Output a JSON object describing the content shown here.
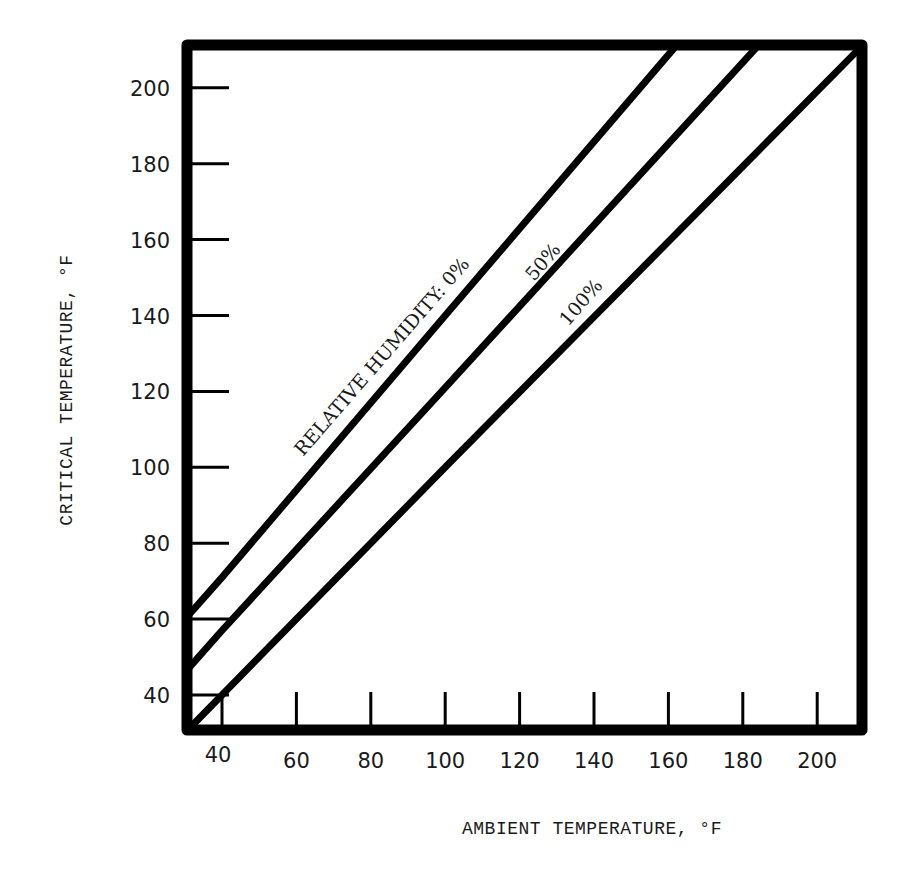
{
  "chart_data": {
    "type": "line",
    "title": "",
    "xlabel": "AMBIENT TEMPERATURE, °F",
    "ylabel": "CRITICAL TEMPERATURE, °F",
    "xlim": [
      31,
      212
    ],
    "ylim": [
      31,
      211
    ],
    "grid": false,
    "legend": "inline annotations along lines",
    "x_ticks": [
      40,
      60,
      80,
      100,
      120,
      140,
      160,
      180,
      200
    ],
    "y_ticks": [
      40,
      60,
      80,
      100,
      120,
      140,
      160,
      180,
      200
    ],
    "annotation_prefix": "RELATIVE HUMIDITY:",
    "series": [
      {
        "name": "0%",
        "label": "0%",
        "points": [
          [
            31,
            61
          ],
          [
            40,
            71
          ],
          [
            100,
            140
          ],
          [
            162,
            211
          ]
        ]
      },
      {
        "name": "50%",
        "label": "50%",
        "points": [
          [
            31,
            47
          ],
          [
            40,
            57
          ],
          [
            100,
            121
          ],
          [
            184,
            211
          ]
        ]
      },
      {
        "name": "100%",
        "label": "100%",
        "points": [
          [
            31,
            31
          ],
          [
            40,
            40
          ],
          [
            100,
            100
          ],
          [
            212,
            211
          ]
        ]
      }
    ]
  },
  "labels": {
    "annotation_full": "RELATIVE HUMIDITY: 0%",
    "line50": "50%",
    "line100": "100%",
    "xlabel": "AMBIENT TEMPERATURE, °F",
    "ylabel": "CRITICAL TEMPERATURE, °F"
  },
  "colors": {
    "ink": "#000000",
    "background": "#ffffff"
  }
}
